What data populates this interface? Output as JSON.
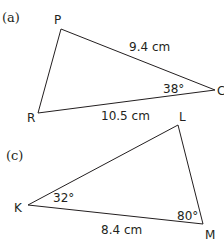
{
  "figures": [
    {
      "part_label": "(a)",
      "vertices": {
        "P": "P",
        "C": "C",
        "R": "R"
      },
      "side_PC": "9.4 cm",
      "side_RC": "10.5 cm",
      "angle_C": "38°"
    },
    {
      "part_label": "(c)",
      "vertices": {
        "L": "L",
        "K": "K",
        "M": "M"
      },
      "side_KM": "8.4 cm",
      "angle_K": "32°",
      "angle_M": "80°"
    }
  ],
  "colors": {
    "line": "#231f20",
    "background": "#ffffff"
  }
}
